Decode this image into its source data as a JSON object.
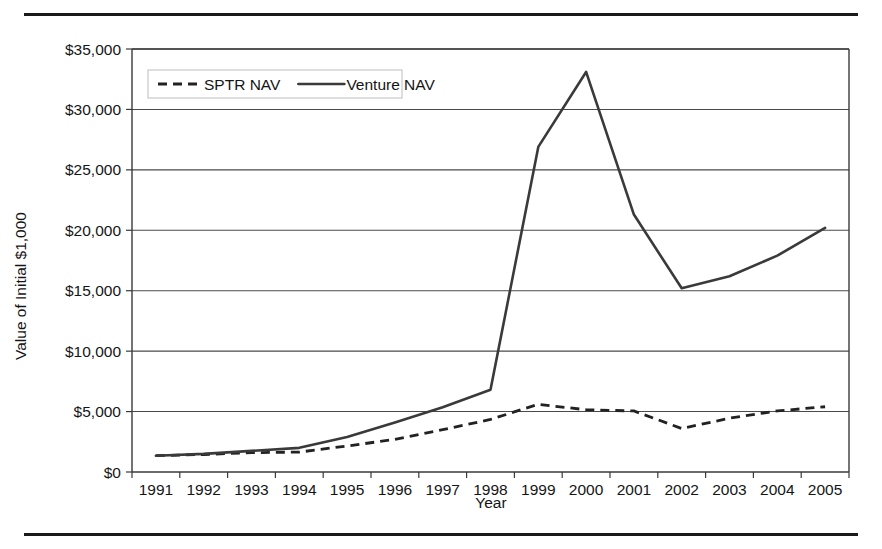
{
  "figure": {
    "has_top_rule": true,
    "has_bottom_rule": true,
    "background": "#ffffff",
    "line_color": "#3a3a3a"
  },
  "chart_data": {
    "type": "line",
    "title": "",
    "xlabel": "Year",
    "ylabel": "Value of Initial $1,000",
    "categories": [
      "1991",
      "1992",
      "1993",
      "1994",
      "1995",
      "1996",
      "1997",
      "1998",
      "1999",
      "2000",
      "2001",
      "2002",
      "2003",
      "2004",
      "2005"
    ],
    "x": [
      1991,
      1992,
      1993,
      1994,
      1995,
      1996,
      1997,
      1998,
      1999,
      2000,
      2001,
      2002,
      2003,
      2004,
      2005
    ],
    "ylim": [
      0,
      35000
    ],
    "yticks": [
      0,
      5000,
      10000,
      15000,
      20000,
      25000,
      30000,
      35000
    ],
    "ytick_labels": [
      "$0",
      "$5,000",
      "$10,000",
      "$15,000",
      "$20,000",
      "$25,000",
      "$30,000",
      "$35,000"
    ],
    "grid": true,
    "grid_axis": "y",
    "legend_position": "upper left",
    "series": [
      {
        "name": "SPTR NAV",
        "style": "dashed",
        "color": "#222222",
        "values": [
          1350,
          1450,
          1600,
          1650,
          2150,
          2700,
          3500,
          4350,
          5600,
          5150,
          5050,
          3600,
          4450,
          5050,
          5400
        ]
      },
      {
        "name": "Venture NAV",
        "style": "solid",
        "color": "#3a3a3a",
        "values": [
          1350,
          1500,
          1750,
          2000,
          2900,
          4100,
          5350,
          6800,
          26900,
          33100,
          21300,
          15200,
          16200,
          17900,
          20200
        ]
      }
    ]
  },
  "legend": {
    "entries": [
      {
        "label": "SPTR NAV",
        "style": "dashed"
      },
      {
        "label": "Venture NAV",
        "style": "solid"
      }
    ]
  }
}
